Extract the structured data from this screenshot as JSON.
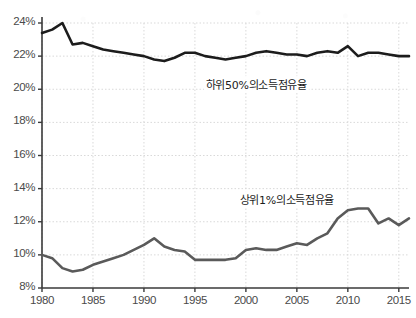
{
  "chart_data": {
    "type": "line",
    "title": "",
    "subtitle": "",
    "xlabel": "",
    "ylabel": "",
    "xlim": [
      1980,
      2016
    ],
    "ylim": [
      8,
      24
    ],
    "ytick_labels": [
      "24%",
      "22%",
      "20%",
      "18%",
      "16%",
      "14%",
      "12%",
      "10%",
      "8%"
    ],
    "ytick_values": [
      24,
      22,
      20,
      18,
      16,
      14,
      12,
      10,
      8
    ],
    "xtick_labels": [
      "1980",
      "1985",
      "1990",
      "1995",
      "2000",
      "2005",
      "2010",
      "2015"
    ],
    "xtick_values": [
      1980,
      1985,
      1990,
      1995,
      2000,
      2005,
      2010,
      2015
    ],
    "grid": true,
    "grid_color": "#d9d9d9",
    "axis_color": "#3a3a3a",
    "legend": "inline-annotations",
    "x": [
      1980,
      1981,
      1982,
      1983,
      1984,
      1985,
      1986,
      1987,
      1988,
      1989,
      1990,
      1991,
      1992,
      1993,
      1994,
      1995,
      1996,
      1997,
      1998,
      1999,
      2000,
      2001,
      2002,
      2003,
      2004,
      2005,
      2006,
      2007,
      2008,
      2009,
      2010,
      2011,
      2012,
      2013,
      2014,
      2015,
      2016
    ],
    "series": [
      {
        "name": "하위50%의소득점유율",
        "color": "#1c1c1c",
        "width": 2.6,
        "label_x": 2001,
        "label_y": 20.3,
        "values": [
          23.4,
          23.6,
          24.0,
          22.7,
          22.8,
          22.6,
          22.4,
          22.3,
          22.2,
          22.1,
          22.0,
          21.8,
          21.7,
          21.9,
          22.2,
          22.2,
          22.0,
          21.9,
          21.8,
          21.9,
          22.0,
          22.2,
          22.3,
          22.2,
          22.1,
          22.1,
          22.0,
          22.2,
          22.3,
          22.2,
          22.6,
          22.0,
          22.2,
          22.2,
          22.1,
          22.0,
          22.0
        ]
      },
      {
        "name": "상위1%의소득점유율",
        "color": "#5a5a5a",
        "width": 2.6,
        "label_x": 2004,
        "label_y": 13.4,
        "values": [
          10.0,
          9.8,
          9.2,
          9.0,
          9.1,
          9.4,
          9.6,
          9.8,
          10.0,
          10.3,
          10.6,
          11.0,
          10.5,
          10.3,
          10.2,
          9.7,
          9.7,
          9.7,
          9.7,
          9.8,
          10.3,
          10.4,
          10.3,
          10.3,
          10.5,
          10.7,
          10.6,
          11.0,
          11.3,
          12.2,
          12.7,
          12.8,
          12.8,
          11.9,
          12.2,
          11.8,
          12.2
        ]
      }
    ]
  },
  "annotations": {
    "bottom50_label": "하위50%의소득점유율",
    "top1_label": "상위1%의소득점유율"
  }
}
